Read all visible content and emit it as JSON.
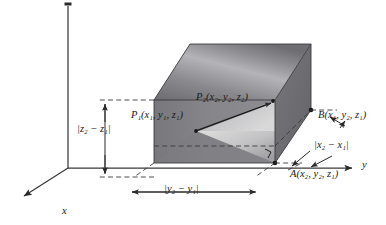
{
  "figure": {
    "type": "3d-distance-formula-diagram",
    "background_color": "#ffffff",
    "ink_color": "#1a1a1a"
  },
  "axes": {
    "x_label": "x",
    "y_label": "y",
    "z_label": "",
    "origin": {
      "x": 68,
      "y": 168
    },
    "x_axis_tip": {
      "x": 16,
      "y": 200
    },
    "y_axis_tip": {
      "x": 358,
      "y": 168
    },
    "z_axis_tip": {
      "x": 68,
      "y": 3
    }
  },
  "points": {
    "p1": {
      "name": "P",
      "subscript": "1",
      "coords": [
        "x",
        "y",
        "z"
      ],
      "coord_subs": [
        "1",
        "1",
        "1"
      ],
      "text": "P₁(x₁, y₁, z₁)"
    },
    "p2": {
      "name": "P",
      "subscript": "2",
      "coords": [
        "x",
        "y",
        "z"
      ],
      "coord_subs": [
        "2",
        "2",
        "2"
      ],
      "text": "P₂(x₂, y₂, z₂)"
    },
    "a": {
      "name": "A",
      "subscript": "",
      "coords": [
        "x",
        "y",
        "z"
      ],
      "coord_subs": [
        "2",
        "2",
        "1"
      ],
      "text": "A(x₂, y₂, z₁)"
    },
    "b": {
      "name": "B",
      "subscript": "",
      "coords": [
        "x",
        "y",
        "z"
      ],
      "coord_subs": [
        "1",
        "2",
        "1"
      ],
      "text": "B(x₁, y₂, z₁)"
    }
  },
  "dimensions": {
    "dz": {
      "text": "|z₂ − z₁|",
      "axis": "z"
    },
    "dy": {
      "text": "|y₂ − y₁|",
      "axis": "y"
    },
    "dx": {
      "text": "|x₂ − x₁|",
      "axis": "x"
    }
  },
  "colors": {
    "box_front_face": "#808083",
    "box_top_face_light": "#b9b9bc",
    "box_top_face_dark": "#6f6f74",
    "box_right_face": "#6c6c71",
    "inner_triangle_light": "#d2d2d2",
    "inner_triangle_mid": "#9a9a9d",
    "line": "#2a2a2a",
    "dashed": "#3a3a3a"
  }
}
